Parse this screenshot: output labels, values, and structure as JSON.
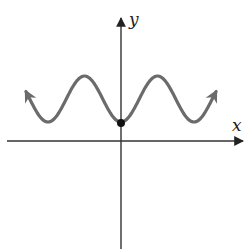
{
  "diagram": {
    "type": "function-graph",
    "axes": {
      "x_label": "x",
      "y_label": "y"
    },
    "curve": {
      "shape": "cosine wave shifted up",
      "color": "#6b6b6b",
      "min_at_y_axis": true,
      "peaks": 2,
      "arrows_on_both_ends": true
    },
    "marked_point": {
      "location": "y-intercept",
      "color": "#111111"
    },
    "colors": {
      "axis": "#333333",
      "curve": "#6b6b6b",
      "point": "#111111"
    }
  }
}
